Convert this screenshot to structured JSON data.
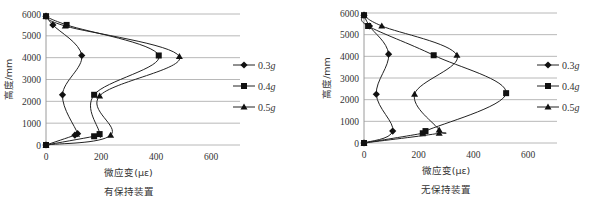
{
  "chart_data": [
    {
      "type": "line",
      "title": "有保持装置",
      "xlabel": "微应变(με)",
      "ylabel": "高度/mm",
      "xlim": [
        0,
        700
      ],
      "ylim": [
        0,
        6000
      ],
      "xticks": [
        0,
        200,
        400,
        600
      ],
      "yticks": [
        0,
        1000,
        2000,
        3000,
        4000,
        5000,
        6000
      ],
      "grid": "horizontal",
      "legend_position": "right",
      "series": [
        {
          "name": "0.3g",
          "marker": "diamond",
          "points": [
            [
              0,
              0
            ],
            [
              105,
              450
            ],
            [
              115,
              520
            ],
            [
              60,
              2300
            ],
            [
              130,
              4100
            ],
            [
              25,
              5500
            ],
            [
              0,
              5900
            ]
          ]
        },
        {
          "name": "0.4g",
          "marker": "square",
          "points": [
            [
              0,
              0
            ],
            [
              175,
              400
            ],
            [
              195,
              500
            ],
            [
              175,
              2300
            ],
            [
              410,
              4100
            ],
            [
              75,
              5500
            ],
            [
              0,
              5900
            ]
          ]
        },
        {
          "name": "0.5g",
          "marker": "triangle",
          "points": [
            [
              0,
              0
            ],
            [
              235,
              450
            ],
            [
              195,
              2250
            ],
            [
              485,
              4050
            ],
            [
              70,
              5450
            ],
            [
              0,
              5900
            ]
          ]
        }
      ]
    },
    {
      "type": "line",
      "title": "无保持装置",
      "xlabel": "微应变(με)",
      "ylabel": "高度/mm",
      "xlim": [
        0,
        700
      ],
      "ylim": [
        0,
        6000
      ],
      "xticks": [
        0,
        200,
        400,
        600
      ],
      "yticks": [
        0,
        1000,
        2000,
        3000,
        4000,
        5000,
        6000
      ],
      "grid": "horizontal",
      "legend_position": "right",
      "series": [
        {
          "name": "0.3g",
          "marker": "diamond",
          "points": [
            [
              0,
              0
            ],
            [
              105,
              550
            ],
            [
              45,
              2250
            ],
            [
              90,
              4100
            ],
            [
              20,
              5400
            ],
            [
              0,
              5900
            ]
          ]
        },
        {
          "name": "0.4g",
          "marker": "square",
          "points": [
            [
              0,
              0
            ],
            [
              215,
              450
            ],
            [
              225,
              550
            ],
            [
              520,
              2300
            ],
            [
              255,
              4050
            ],
            [
              15,
              5400
            ],
            [
              0,
              5900
            ]
          ]
        },
        {
          "name": "0.5g",
          "marker": "triangle",
          "points": [
            [
              0,
              0
            ],
            [
              275,
              450
            ],
            [
              275,
              600
            ],
            [
              185,
              2250
            ],
            [
              340,
              4050
            ],
            [
              65,
              5400
            ],
            [
              0,
              5900
            ]
          ]
        }
      ]
    }
  ],
  "charts": [
    {
      "title": "有保持装置",
      "xlabel": "微应变(με)",
      "ylabel": "高度/mm"
    },
    {
      "title": "无保持装置",
      "xlabel": "微应变(με)",
      "ylabel": "高度/mm"
    }
  ],
  "legend": [
    "0.3",
    "0.4",
    "0.5"
  ],
  "legend_unit": "g"
}
